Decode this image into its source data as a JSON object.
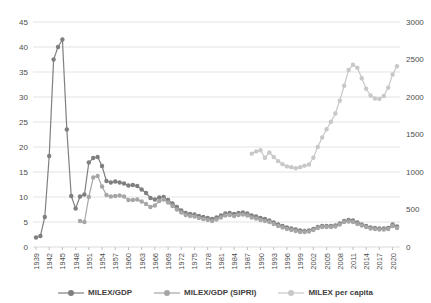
{
  "chart_data": {
    "type": "line",
    "title": "",
    "xlabel": "",
    "ylabel_left": "",
    "ylabel_right": "",
    "grid": true,
    "legend_position": "bottom",
    "x_axis": {
      "start_year": 1939,
      "end_year": 2021,
      "tick_labels": [
        "1939",
        "1942",
        "1945",
        "1948",
        "1951",
        "1954",
        "1957",
        "1960",
        "1963",
        "1966",
        "1969",
        "1972",
        "1975",
        "1978",
        "1981",
        "1984",
        "1987",
        "1990",
        "1993",
        "1996",
        "1999",
        "2002",
        "2005",
        "2008",
        "2011",
        "2014",
        "2017",
        "2020"
      ]
    },
    "y_axis_left": {
      "min": 0,
      "max": 45,
      "step": 5,
      "tick_labels": [
        "0",
        "5",
        "10",
        "15",
        "20",
        "25",
        "30",
        "35",
        "40",
        "45"
      ]
    },
    "y_axis_right": {
      "min": 0,
      "max": 3000,
      "step": 500,
      "tick_labels": [
        "0",
        "500",
        "1000",
        "1500",
        "2000",
        "2500",
        "3000"
      ]
    },
    "series": [
      {
        "name": "MILEX/GDP",
        "axis": "left",
        "color": "#7f7f7f",
        "start_year": 1939,
        "values": [
          1.9,
          2.2,
          6.0,
          18.2,
          37.5,
          40.0,
          41.5,
          23.5,
          10.2,
          7.7,
          10.1,
          10.5,
          16.9,
          17.8,
          18.0,
          16.2,
          13.2,
          12.9,
          13.1,
          12.9,
          12.7,
          12.3,
          12.4,
          12.2,
          11.5,
          10.8,
          9.8,
          9.5,
          9.9,
          10.0,
          9.4,
          8.7,
          8.0,
          7.3,
          6.8,
          6.6,
          6.5,
          6.2,
          6.0,
          5.8,
          5.6,
          5.9,
          6.3,
          6.7,
          6.8,
          6.6,
          6.8,
          6.9,
          6.7,
          6.3,
          6.1,
          5.8,
          5.6,
          5.3,
          4.9,
          4.5,
          4.2,
          3.9,
          3.7,
          3.5,
          3.3,
          3.2,
          3.3,
          3.6,
          4.0,
          4.2,
          4.2,
          4.2,
          4.3,
          4.7,
          5.2,
          5.4,
          5.3,
          4.9,
          4.5,
          4.2,
          3.9,
          3.8,
          3.7,
          3.7,
          3.8,
          4.5,
          4.1
        ]
      },
      {
        "name": "MILEX/GDP (SIPRI)",
        "axis": "left",
        "color": "#a6a6a6",
        "start_year": 1949,
        "values": [
          5.2,
          5.0,
          10.0,
          13.9,
          14.2,
          12.1,
          10.4,
          10.1,
          10.2,
          10.3,
          10.1,
          9.4,
          9.4,
          9.5,
          9.1,
          8.6,
          8.0,
          8.3,
          9.2,
          9.5,
          8.9,
          8.2,
          7.5,
          6.9,
          6.4,
          6.2,
          6.1,
          5.8,
          5.6,
          5.4,
          5.2,
          5.5,
          5.9,
          6.3,
          6.4,
          6.2,
          6.4,
          6.5,
          6.3,
          5.9,
          5.7,
          5.4,
          5.2,
          5.0,
          4.6,
          4.2,
          3.9,
          3.6,
          3.4,
          3.2,
          3.0,
          3.0,
          3.1,
          3.4,
          3.8,
          4.0,
          4.0,
          4.0,
          4.1,
          4.5,
          5.0,
          5.1,
          5.0,
          4.6,
          4.3,
          4.0,
          3.7,
          3.6,
          3.5,
          3.5,
          3.6,
          4.2,
          3.8
        ]
      },
      {
        "name": "MILEX per capita",
        "axis": "right",
        "color": "#c8c8c8",
        "start_year": 1988,
        "values": [
          1245,
          1275,
          1290,
          1190,
          1260,
          1200,
          1145,
          1105,
          1075,
          1065,
          1050,
          1065,
          1085,
          1100,
          1190,
          1335,
          1460,
          1570,
          1670,
          1780,
          1950,
          2150,
          2360,
          2430,
          2390,
          2250,
          2110,
          2020,
          1980,
          1975,
          2015,
          2125,
          2300,
          2410
        ]
      }
    ],
    "style": {
      "gridline_color": "#e3e3e3",
      "axis_line_color": "#d9d9d9",
      "tick_color": "#bfbfbf",
      "axis_label_color": "#4d4d4d",
      "legend_text_color": "#404040"
    }
  }
}
